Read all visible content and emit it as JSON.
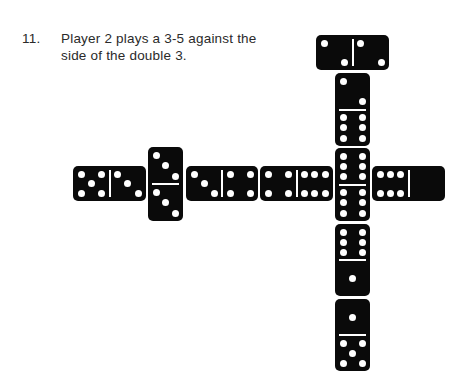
{
  "caption": {
    "number": "11.",
    "line1": "Player 2 plays a 3-5 against the",
    "line2": "side of the double 3."
  },
  "colors": {
    "domino": "#0a0a0a",
    "pip": "#ffffff",
    "text": "#2a2a2a"
  },
  "dominoes": [
    {
      "id": "5-3",
      "orientation": "horizontal",
      "a": 5,
      "b": 3,
      "x": 73,
      "y": 166,
      "w": 73,
      "h": 35
    },
    {
      "id": "3-3",
      "orientation": "vertical",
      "a": 3,
      "b": 3,
      "x": 148,
      "y": 147,
      "w": 35,
      "h": 74
    },
    {
      "id": "3-4",
      "orientation": "horizontal",
      "a": 3,
      "b": 4,
      "x": 186,
      "y": 166,
      "w": 72,
      "h": 35
    },
    {
      "id": "4-6",
      "orientation": "horizontal",
      "a": 4,
      "b": 6,
      "x": 260,
      "y": 166,
      "w": 73,
      "h": 35
    },
    {
      "id": "6-6",
      "orientation": "vertical",
      "a": 6,
      "b": 6,
      "x": 335,
      "y": 148,
      "w": 35,
      "h": 73
    },
    {
      "id": "6-0",
      "orientation": "horizontal",
      "a": 6,
      "b": 0,
      "x": 372,
      "y": 166,
      "w": 73,
      "h": 35
    },
    {
      "id": "2-2",
      "orientation": "horizontal",
      "a": 2,
      "b": 2,
      "x": 316,
      "y": 35,
      "w": 73,
      "h": 35
    },
    {
      "id": "2-6",
      "orientation": "vertical",
      "a": 2,
      "b": 6,
      "x": 335,
      "y": 73,
      "w": 35,
      "h": 73
    },
    {
      "id": "6-1",
      "orientation": "vertical",
      "a": 6,
      "b": 1,
      "x": 335,
      "y": 224,
      "w": 35,
      "h": 72
    },
    {
      "id": "1-5",
      "orientation": "vertical",
      "a": 1,
      "b": 5,
      "x": 335,
      "y": 299,
      "w": 35,
      "h": 72
    }
  ]
}
